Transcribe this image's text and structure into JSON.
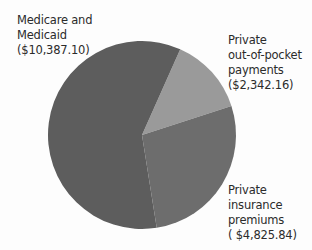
{
  "chart_data": {
    "type": "pie",
    "title": "",
    "start_angle_deg": 24,
    "direction": "clockwise",
    "slices": [
      {
        "name": "Private out-of-pocket payments",
        "value": 2342.16,
        "value_label": "($2,342.16)",
        "color": "#9a9a9a"
      },
      {
        "name": "Private insurance premiums",
        "value": 4825.84,
        "value_label": "( $4,825.84)",
        "color": "#6d6d6d"
      },
      {
        "name": "Medicare and Medicaid",
        "value": 10387.1,
        "value_label": "($10,387.10)",
        "color": "#5d5d5d"
      }
    ],
    "categories": [
      "Medicare and Medicaid",
      "Private out-of-pocket payments",
      "Private insurance premiums"
    ],
    "values": [
      10387.1,
      2342.16,
      4825.84
    ],
    "legend": "none (direct labels)"
  },
  "geometry": {
    "cx": 142,
    "cy": 135,
    "r": 94
  },
  "labels": {
    "medicare": {
      "lines": [
        "Medicare and",
        "Medicaid",
        "($10,387.10)"
      ]
    },
    "out_of_pocket": {
      "lines": [
        "Private",
        "out-of-pocket",
        "payments",
        "($2,342.16)"
      ]
    },
    "insurance": {
      "lines": [
        "Private",
        "insurance",
        "premiums",
        "( $4,825.84)"
      ]
    }
  }
}
